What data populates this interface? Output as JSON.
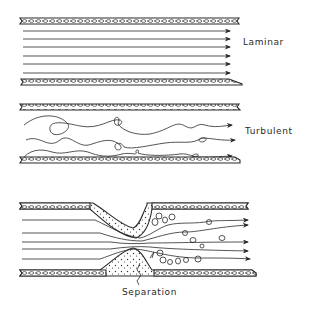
{
  "diagram": {
    "panels": [
      {
        "id": "laminar",
        "label": "Laminar"
      },
      {
        "id": "turbulent",
        "label": "Turbulent"
      },
      {
        "id": "stenosis",
        "label": "Separation"
      }
    ]
  },
  "colors": {
    "ink": "#2a2a2a",
    "wall_fill": "#ffffff",
    "background": "#ffffff"
  }
}
